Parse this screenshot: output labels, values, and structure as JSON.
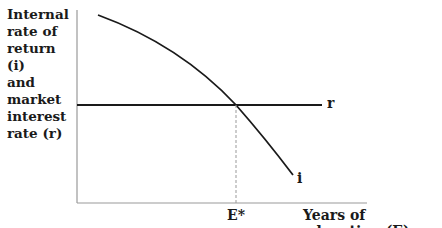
{
  "diagram": {
    "y_axis_label": "Internal\nrate of\nreturn (i)\nand\nmarket\ninterest\nrate (r)",
    "x_axis_label": "Years of education (E)",
    "curves": [
      {
        "name": "i",
        "label": "i",
        "description": "Internal rate of return, downward sloping concave curve"
      },
      {
        "name": "r",
        "label": "r",
        "description": "Market interest rate, horizontal line"
      }
    ],
    "equilibrium_label": "E*",
    "colors": {
      "line": "#1a1a1a",
      "axis": "#888888",
      "dashed": "#999999"
    }
  }
}
